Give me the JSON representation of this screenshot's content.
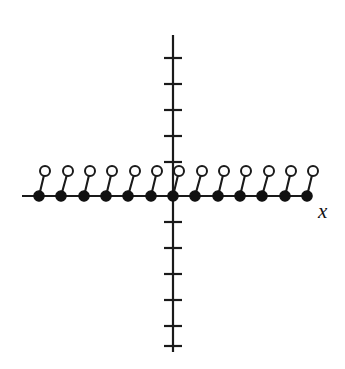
{
  "figure": {
    "title": "",
    "background_color": "#ffffff",
    "ink_color": "#111111",
    "x_axis_label": "x",
    "y_axis_label": ""
  },
  "chart_data": {
    "type": "scatter",
    "title": "",
    "subtitle": "",
    "xlabel": "x",
    "ylabel": "",
    "grid": false,
    "legend": null,
    "legend_position": "none",
    "axes": {
      "x_axis": {
        "pixel_y": 196,
        "pixel_x_start": 22,
        "pixel_x_end": 312,
        "arrow": false,
        "tick_labels": [],
        "ticks_drawn": false
      },
      "y_axis": {
        "pixel_x": 173,
        "pixel_y_start": 35,
        "pixel_y_end": 352,
        "arrow": false,
        "tick_labels": [],
        "ticks_drawn": true,
        "tick_half_width": 9,
        "tick_spacing_px": 26,
        "ticks_above_origin": 5,
        "ticks_below_origin": 6
      },
      "origin_pixel": [
        173,
        196
      ],
      "unit_px_x": 22.3,
      "unit_px_y": 25
    },
    "series": [
      {
        "name": "closed endpoints",
        "marker": "filled-circle",
        "marker_radius_px": 5.2,
        "point_count": 13,
        "x": [
          -6,
          -5,
          -4,
          -3,
          -2,
          -1,
          0,
          1,
          2,
          3,
          4,
          5,
          6
        ],
        "y": [
          0,
          0,
          0,
          0,
          0,
          0,
          0,
          0,
          0,
          0,
          0,
          0,
          0
        ],
        "pixel_points": [
          [
            39,
            196
          ],
          [
            61,
            196
          ],
          [
            84,
            196
          ],
          [
            106,
            196
          ],
          [
            128,
            196
          ],
          [
            151,
            196
          ],
          [
            173,
            196
          ],
          [
            195,
            196
          ],
          [
            218,
            196
          ],
          [
            240,
            196
          ],
          [
            262,
            196
          ],
          [
            285,
            196
          ],
          [
            307,
            196
          ]
        ]
      },
      {
        "name": "open endpoints",
        "marker": "open-circle",
        "marker_radius_px": 5.0,
        "point_count": 13,
        "x": [
          -6,
          -5,
          -4,
          -3,
          -2,
          -1,
          0,
          1,
          2,
          3,
          4,
          5,
          6
        ],
        "y": [
          1,
          1,
          1,
          1,
          1,
          1,
          1,
          1,
          1,
          1,
          1,
          1,
          1
        ],
        "pixel_points": [
          [
            45,
            171
          ],
          [
            68,
            171
          ],
          [
            90,
            171
          ],
          [
            112,
            171
          ],
          [
            135,
            171
          ],
          [
            157,
            171
          ],
          [
            179,
            171
          ],
          [
            202,
            171
          ],
          [
            224,
            171
          ],
          [
            246,
            171
          ],
          [
            269,
            171
          ],
          [
            291,
            171
          ],
          [
            313,
            171
          ]
        ]
      }
    ],
    "segments": [
      {
        "from_pixel": [
          39,
          196
        ],
        "to_pixel": [
          45,
          171
        ],
        "closed_at": "start",
        "open_at": "end"
      },
      {
        "from_pixel": [
          61,
          196
        ],
        "to_pixel": [
          68,
          171
        ],
        "closed_at": "start",
        "open_at": "end"
      },
      {
        "from_pixel": [
          84,
          196
        ],
        "to_pixel": [
          90,
          171
        ],
        "closed_at": "start",
        "open_at": "end"
      },
      {
        "from_pixel": [
          106,
          196
        ],
        "to_pixel": [
          112,
          171
        ],
        "closed_at": "start",
        "open_at": "end"
      },
      {
        "from_pixel": [
          128,
          196
        ],
        "to_pixel": [
          135,
          171
        ],
        "closed_at": "start",
        "open_at": "end"
      },
      {
        "from_pixel": [
          151,
          196
        ],
        "to_pixel": [
          157,
          171
        ],
        "closed_at": "start",
        "open_at": "end"
      },
      {
        "from_pixel": [
          173,
          196
        ],
        "to_pixel": [
          179,
          171
        ],
        "closed_at": "start",
        "open_at": "end"
      },
      {
        "from_pixel": [
          195,
          196
        ],
        "to_pixel": [
          202,
          171
        ],
        "closed_at": "start",
        "open_at": "end"
      },
      {
        "from_pixel": [
          218,
          196
        ],
        "to_pixel": [
          224,
          171
        ],
        "closed_at": "start",
        "open_at": "end"
      },
      {
        "from_pixel": [
          240,
          196
        ],
        "to_pixel": [
          246,
          171
        ],
        "closed_at": "start",
        "open_at": "end"
      },
      {
        "from_pixel": [
          262,
          196
        ],
        "to_pixel": [
          269,
          171
        ],
        "closed_at": "start",
        "open_at": "end"
      },
      {
        "from_pixel": [
          285,
          196
        ],
        "to_pixel": [
          291,
          171
        ],
        "closed_at": "start",
        "open_at": "end"
      },
      {
        "from_pixel": [
          307,
          196
        ],
        "to_pixel": [
          313,
          171
        ],
        "closed_at": "start",
        "open_at": "end"
      }
    ],
    "y_axis_tick_pixels": [
      58,
      84,
      110,
      136,
      162,
      222,
      248,
      274,
      300,
      326,
      346
    ]
  }
}
